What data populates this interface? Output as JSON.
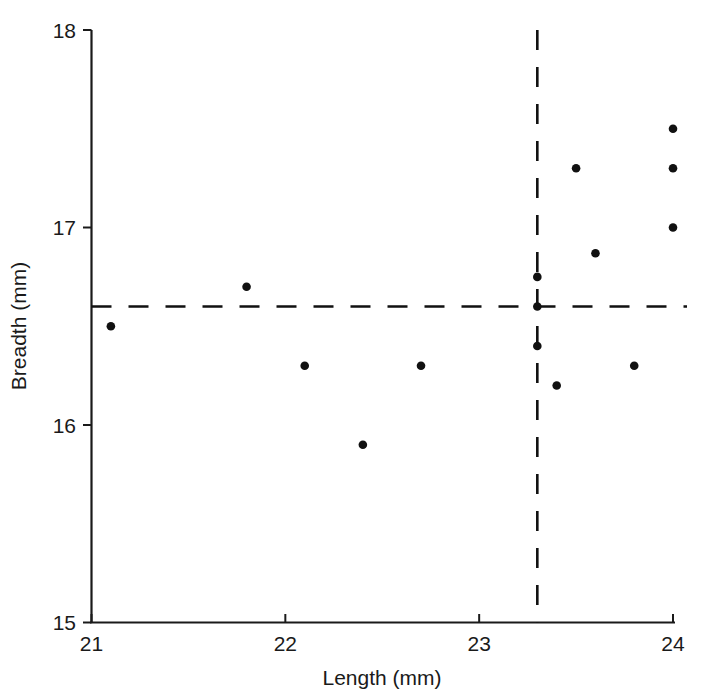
{
  "chart_data": {
    "type": "scatter",
    "title": "",
    "xlabel": "Length (mm)",
    "ylabel": "Breadth (mm)",
    "xlim": [
      21,
      24
    ],
    "ylim": [
      15,
      18
    ],
    "xticks": [
      21,
      22,
      23,
      24
    ],
    "yticks": [
      15,
      16,
      17,
      18
    ],
    "xtick_labels": [
      "21",
      "22",
      "23",
      "24"
    ],
    "ytick_labels": [
      "15",
      "16",
      "17",
      "18"
    ],
    "grid": false,
    "legend": "none",
    "marker": "filled-circle",
    "marker_color": "#111111",
    "points": [
      {
        "x": 21.1,
        "y": 16.5
      },
      {
        "x": 21.8,
        "y": 16.7
      },
      {
        "x": 22.1,
        "y": 16.3
      },
      {
        "x": 22.4,
        "y": 15.9
      },
      {
        "x": 22.7,
        "y": 16.3
      },
      {
        "x": 23.3,
        "y": 16.4
      },
      {
        "x": 23.3,
        "y": 16.6
      },
      {
        "x": 23.3,
        "y": 16.75
      },
      {
        "x": 23.4,
        "y": 16.2
      },
      {
        "x": 23.5,
        "y": 17.3
      },
      {
        "x": 23.6,
        "y": 16.87
      },
      {
        "x": 23.8,
        "y": 16.3
      },
      {
        "x": 24.0,
        "y": 17.0
      },
      {
        "x": 24.0,
        "y": 17.3
      },
      {
        "x": 24.0,
        "y": 17.5
      }
    ],
    "reference_lines": [
      {
        "orientation": "horizontal",
        "value": 16.6,
        "style": "dashed",
        "color": "#111111"
      },
      {
        "orientation": "vertical",
        "value": 23.3,
        "style": "dashed",
        "color": "#111111"
      }
    ]
  },
  "axes": {
    "x_title": "Length (mm)",
    "y_title": "Breadth (mm)"
  }
}
